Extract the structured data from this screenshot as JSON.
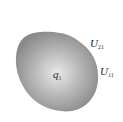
{
  "diagram": {
    "shape": "conductor-blob",
    "fill_center": "#e6e6e6",
    "fill_edge": "#8c8c8c",
    "labels": {
      "charge": {
        "main": "q",
        "sub": "1"
      },
      "potential_outer": {
        "main": "U",
        "sub": "21"
      },
      "potential_surface": {
        "main": "U",
        "sub": "11"
      }
    }
  }
}
